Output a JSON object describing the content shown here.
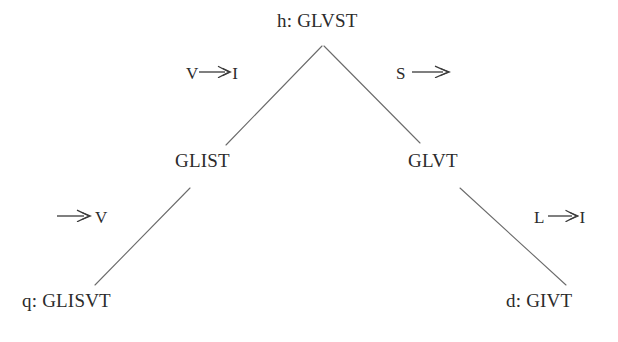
{
  "diagram": {
    "type": "derivation-tree",
    "background_color": "#ffffff",
    "text_color": "#2b2b2b",
    "edge_color": "#6b6b6b",
    "nodes": [
      {
        "id": "root",
        "label": "h: GLVST",
        "level": 0
      },
      {
        "id": "left",
        "label": "GLIST",
        "level": 1
      },
      {
        "id": "right",
        "label": "GLVT",
        "level": 1
      },
      {
        "id": "leaf_l",
        "label": "q: GLISVT",
        "level": 2
      },
      {
        "id": "leaf_r",
        "label": "d: GIVT",
        "level": 2
      }
    ],
    "edges": [
      {
        "id": "root-left",
        "from": "root",
        "to": "left",
        "from_symbol": "V",
        "to_symbol": "I",
        "operation": "substitution"
      },
      {
        "id": "root-right",
        "from": "root",
        "to": "right",
        "from_symbol": "S",
        "to_symbol": "",
        "operation": "deletion"
      },
      {
        "id": "left-leaf",
        "from": "left",
        "to": "leaf_l",
        "from_symbol": "",
        "to_symbol": "V",
        "operation": "insertion"
      },
      {
        "id": "right-leaf",
        "from": "right",
        "to": "leaf_r",
        "from_symbol": "L",
        "to_symbol": "I",
        "operation": "substitution"
      }
    ],
    "arrow_glyph_name": "long-rightwards-arrow"
  }
}
